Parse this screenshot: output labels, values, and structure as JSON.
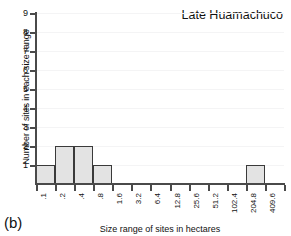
{
  "figure": {
    "panel_label": "(b)",
    "title": "Late Huamachuco"
  },
  "axes": {
    "xlabel": "Size range of sites in hectares",
    "ylabel": "Number of sites in each size range",
    "ytick_labels": [
      "1",
      "2",
      "3",
      "4",
      "5",
      "6",
      "7",
      "8",
      "9"
    ],
    "xtick_labels": [
      ".1",
      ".2",
      ".4",
      ".8",
      "1.6",
      "3.2",
      "6.4",
      "12.8",
      "25.6",
      "51.2",
      "102.4",
      "204.8",
      "409.6"
    ]
  },
  "colors": {
    "bar_fill": "#e3e3e3",
    "bar_edge": "#3a3a3a",
    "axis": "#4a4a4a",
    "grid": "#f4f4f5",
    "text": "#111111",
    "background": "#ffffff"
  },
  "chart_data": {
    "type": "bar",
    "title": "Late Huamachuco",
    "xlabel": "Size range of sites in hectares",
    "ylabel": "Number of sites in each size range",
    "categories": [
      ".1",
      ".2",
      ".4",
      ".8",
      "1.6",
      "3.2",
      "6.4",
      "12.8",
      "25.6",
      "51.2",
      "102.4",
      "204.8",
      "409.6"
    ],
    "values": [
      1,
      2,
      2,
      1,
      0,
      0,
      0,
      0,
      0,
      0,
      0,
      1,
      0
    ],
    "ylim": [
      0,
      9
    ],
    "yticks": [
      1,
      2,
      3,
      4,
      5,
      6,
      7,
      8,
      9
    ],
    "grid": true,
    "grid_axis": "y",
    "legend": false,
    "bar_align": "edge"
  }
}
